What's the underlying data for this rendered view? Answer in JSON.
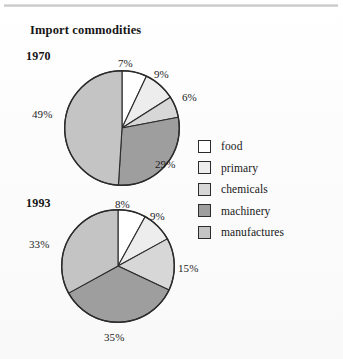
{
  "figure": {
    "title": "Import commodities",
    "background_color": "#fdfdfd",
    "rule_color": "#c9c9c9"
  },
  "legend": {
    "position": "right",
    "items": [
      {
        "label": "food",
        "color": "#ffffff",
        "border": "#2b2b2b"
      },
      {
        "label": "primary",
        "color": "#ededed",
        "border": "#2b2b2b"
      },
      {
        "label": "chemicals",
        "color": "#d7d7d7",
        "border": "#2b2b2b"
      },
      {
        "label": "machinery",
        "color": "#9e9e9e",
        "border": "#2b2b2b"
      },
      {
        "label": "manufactures",
        "color": "#c4c4c4",
        "border": "#2b2b2b"
      }
    ]
  },
  "charts": [
    {
      "year": "1970",
      "labels": [
        "7%",
        "9%",
        "6%",
        "29%",
        "49%"
      ]
    },
    {
      "year": "1993",
      "labels": [
        "8%",
        "9%",
        "15%",
        "35%",
        "33%"
      ]
    }
  ],
  "chart_data": [
    {
      "type": "pie",
      "title": "Import commodities",
      "subtitle": "1970",
      "categories": [
        "food",
        "primary",
        "chemicals",
        "machinery",
        "manufactures"
      ],
      "values": [
        7,
        9,
        6,
        29,
        49
      ],
      "value_labels": [
        "7%",
        "9%",
        "6%",
        "29%",
        "49%"
      ],
      "colors": [
        "#ffffff",
        "#ededed",
        "#d7d7d7",
        "#9e9e9e",
        "#c4c4c4"
      ],
      "units": "percent",
      "start_angle_deg": 0,
      "direction": "clockwise",
      "legend": "right",
      "grid": false
    },
    {
      "type": "pie",
      "title": "Import commodities",
      "subtitle": "1993",
      "categories": [
        "food",
        "primary",
        "chemicals",
        "machinery",
        "manufactures"
      ],
      "values": [
        8,
        9,
        15,
        35,
        33
      ],
      "value_labels": [
        "8%",
        "9%",
        "15%",
        "35%",
        "33%"
      ],
      "colors": [
        "#ffffff",
        "#ededed",
        "#d7d7d7",
        "#9e9e9e",
        "#c4c4c4"
      ],
      "units": "percent",
      "start_angle_deg": 0,
      "direction": "clockwise",
      "legend": "right",
      "grid": false
    }
  ]
}
